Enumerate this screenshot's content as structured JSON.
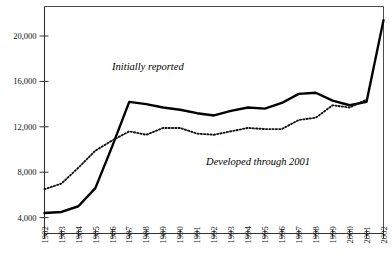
{
  "chart_data": {
    "type": "line",
    "title": "",
    "subtitle": "",
    "xlabel": "",
    "ylabel": "",
    "grid": false,
    "legend_position": "inline-annotation",
    "x": [
      1982,
      1983,
      1984,
      1985,
      1986,
      1987,
      1988,
      1989,
      1990,
      1991,
      1992,
      1993,
      1994,
      1995,
      1996,
      1997,
      1998,
      1999,
      2000,
      2001,
      2002
    ],
    "xlim": [
      1982,
      2002
    ],
    "ylim": [
      2600,
      22600
    ],
    "yticks": [
      4000,
      8000,
      12000,
      16000,
      20000
    ],
    "ytick_labels": [
      "4,000",
      "8,000",
      "12,000",
      "16,000",
      "20,000"
    ],
    "xtick_labels": [
      "1982",
      "1983",
      "1984",
      "1985",
      "1986",
      "1987",
      "1988",
      "1989",
      "1990",
      "1991",
      "1992",
      "1993",
      "1994",
      "1995",
      "1996",
      "1997",
      "1998",
      "1999",
      "2000",
      "2001",
      "2002"
    ],
    "series": [
      {
        "name": "Initially reported",
        "style": "solid",
        "color": "#000000",
        "values": [
          4400,
          4500,
          5000,
          6600,
          10300,
          14200,
          14000,
          13700,
          13500,
          13200,
          13000,
          13400,
          13700,
          13600,
          14100,
          14900,
          15000,
          14300,
          13900,
          14200,
          21400
        ]
      },
      {
        "name": "Developed through 2001",
        "style": "dotted",
        "color": "#111111",
        "values": [
          6500,
          7000,
          8400,
          9900,
          10800,
          11600,
          11300,
          11900,
          11900,
          11400,
          11300,
          11600,
          11900,
          11800,
          11800,
          12600,
          12800,
          13900,
          13700,
          14400,
          null
        ]
      }
    ],
    "annotations": [
      {
        "text": "Initially reported",
        "x": 1988.1,
        "y": 17000,
        "style": "italic"
      },
      {
        "text": "Developed through 2001",
        "x": 1994.6,
        "y": 8600,
        "style": "italic"
      }
    ]
  }
}
